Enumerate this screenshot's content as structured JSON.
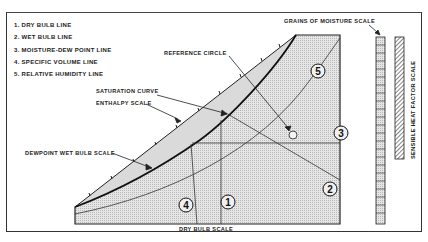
{
  "legend": {
    "items": [
      {
        "label": "1. DRY BULB LINE"
      },
      {
        "label": "2. WET BULB LINE"
      },
      {
        "label": "3. MOISTURE-DEW POINT LINE"
      },
      {
        "label": "4. SPECIFIC VOLUME LINE"
      },
      {
        "label": "5. RELATIVE HUMIDITY LINE"
      }
    ]
  },
  "labels": {
    "grains_scale": "GRAINS OF MOISTURE SCALE",
    "reference_circle": "REFERENCE CIRCLE",
    "saturation_curve": "SATURATION CURVE",
    "enthalpy_scale": "ENTHALPY SCALE",
    "dewpoint_scale": "DEWPOINT WET BULB SCALE",
    "dry_bulb_scale": "DRY BULB SCALE",
    "sensible_heat_scale": "SENSIBLE HEAT FACTOR SCALE"
  },
  "markers": {
    "m1": "1",
    "m2": "2",
    "m3": "3",
    "m4": "4",
    "m5": "5"
  },
  "colors": {
    "ink": "#222222",
    "fill_light": "#d8d8d8",
    "fill_dotted": "#c8c8c8"
  }
}
